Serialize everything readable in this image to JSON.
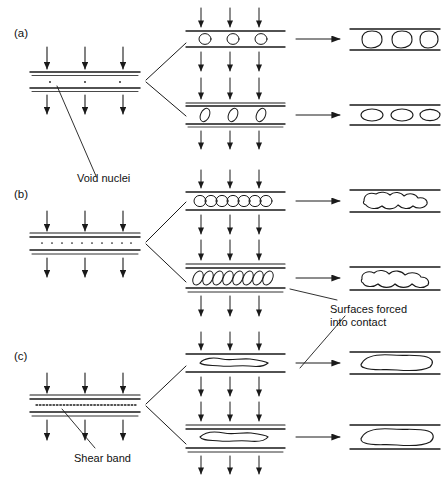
{
  "figure": {
    "type": "schematic-diagram",
    "panel_labels": [
      {
        "id": "a",
        "text": "(a)",
        "x": 14,
        "y": 27
      },
      {
        "id": "b",
        "text": "(b)",
        "x": 14,
        "y": 188
      },
      {
        "id": "c",
        "text": "(c)",
        "x": 14,
        "y": 350
      }
    ],
    "annotations": [
      {
        "id": "void-nuclei",
        "text": "Void nuclei",
        "x": 77,
        "y": 172,
        "lines": [
          "Void nuclei"
        ]
      },
      {
        "id": "shear-band",
        "text": "Shear band",
        "x": 74,
        "y": 452,
        "lines": [
          "Shear band"
        ]
      },
      {
        "id": "surfaces-forced",
        "text": "Surfaces forced into contact",
        "x": 330,
        "y": 306,
        "lines": [
          "Surfaces forced",
          "into contact"
        ]
      }
    ],
    "columns": {
      "left_label": "initial state",
      "middle_label": "void growth",
      "right_label": "coalescence"
    },
    "rows": [
      {
        "label": "(a)",
        "left": {
          "interface": "three small round void nuclei between two parallel bands"
        },
        "middle_top": {
          "voids": "three small circles"
        },
        "middle_bottom": {
          "voids": "three tilted ovals"
        },
        "right_top": {
          "voids": "three large rounded voids"
        },
        "right_bottom": {
          "voids": "three flattened ellipses"
        }
      },
      {
        "label": "(b)",
        "left": {
          "interface": "row of many closely spaced void nuclei"
        },
        "middle_top": {
          "voids": "chain of eight overlapping circles"
        },
        "middle_bottom": {
          "voids": "chain of nine overlapping tilted ovals"
        },
        "right_top": {
          "voids": "single coalesced wavy blob"
        },
        "right_bottom": {
          "voids": "single coalesced wavy elongated blob"
        }
      },
      {
        "label": "(c)",
        "left": {
          "interface": "dense dashed shear band line"
        },
        "middle_top": {
          "voids": "single thin elongated void"
        },
        "middle_bottom": {
          "voids": "single thin elongated void"
        },
        "right_top": {
          "voids": "single large flat lens void"
        },
        "right_bottom": {
          "voids": "single large flat lens void"
        }
      }
    ],
    "arrows": {
      "load_arrow_label": "applied tensile load",
      "transition_arrow_label": "evolves to",
      "branch_arrow_label": "branches to"
    },
    "colors": {
      "ink": "#1a1a1a",
      "background": "#ffffff",
      "text": "#111111"
    },
    "caption": ""
  }
}
